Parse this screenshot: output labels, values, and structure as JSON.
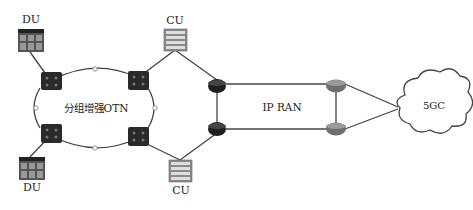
{
  "diagram": {
    "labels": {
      "du_top": "DU",
      "du_bottom": "DU",
      "cu_top": "CU",
      "cu_bottom": "CU",
      "otn_ring": "分组增强OTN",
      "ipran": "IP RAN",
      "core": "5GC"
    },
    "colors": {
      "line": "#444444",
      "otn_node": "#2a2a2a",
      "router_dark": "#1e1e1e",
      "router_light": "#6e6e6e",
      "server": "#8a8a8a"
    }
  }
}
